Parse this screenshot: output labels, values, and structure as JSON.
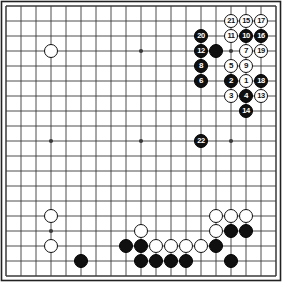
{
  "board": {
    "kind": "go-board",
    "size": 19,
    "grid_spacing": 15,
    "origin_x": 6,
    "origin_y": 6,
    "line_color": "#3a3a3a",
    "border_color": "#222222",
    "background_color": "#ffffff",
    "black_color": "#101010",
    "white_color": "#ffffff",
    "star_points": [
      {
        "col": 3,
        "row": 3
      },
      {
        "col": 9,
        "row": 3
      },
      {
        "col": 15,
        "row": 3
      },
      {
        "col": 3,
        "row": 9
      },
      {
        "col": 9,
        "row": 9
      },
      {
        "col": 15,
        "row": 9
      },
      {
        "col": 3,
        "row": 15
      },
      {
        "col": 9,
        "row": 15
      },
      {
        "col": 15,
        "row": 15
      }
    ],
    "numbered_stones": [
      {
        "label": "1",
        "color": "white",
        "col": 16,
        "row": 5
      },
      {
        "label": "2",
        "color": "black",
        "col": 15,
        "row": 5
      },
      {
        "label": "3",
        "color": "white",
        "col": 15,
        "row": 6
      },
      {
        "label": "4",
        "color": "black",
        "col": 16,
        "row": 6
      },
      {
        "label": "5",
        "color": "white",
        "col": 15,
        "row": 4
      },
      {
        "label": "6",
        "color": "black",
        "col": 13,
        "row": 5
      },
      {
        "label": "7",
        "color": "white",
        "col": 16,
        "row": 3
      },
      {
        "label": "8",
        "color": "black",
        "col": 13,
        "row": 4
      },
      {
        "label": "9",
        "color": "white",
        "col": 16,
        "row": 4
      },
      {
        "label": "10",
        "color": "black",
        "col": 16,
        "row": 2
      },
      {
        "label": "11",
        "color": "white",
        "col": 15,
        "row": 2
      },
      {
        "label": "12",
        "color": "black",
        "col": 13,
        "row": 3
      },
      {
        "label": "13",
        "color": "white",
        "col": 17,
        "row": 6
      },
      {
        "label": "14",
        "color": "black",
        "col": 16,
        "row": 7
      },
      {
        "label": "15",
        "color": "white",
        "col": 16,
        "row": 1
      },
      {
        "label": "16",
        "color": "black",
        "col": 17,
        "row": 2
      },
      {
        "label": "17",
        "color": "white",
        "col": 17,
        "row": 1
      },
      {
        "label": "18",
        "color": "black",
        "col": 17,
        "row": 5
      },
      {
        "label": "19",
        "color": "white",
        "col": 17,
        "row": 3
      },
      {
        "label": "20",
        "color": "black",
        "col": 13,
        "row": 2
      },
      {
        "label": "21",
        "color": "white",
        "col": 15,
        "row": 1
      },
      {
        "label": "22",
        "color": "black",
        "col": 13,
        "row": 9
      }
    ],
    "plain_stones": [
      {
        "color": "black",
        "col": 14,
        "row": 3
      },
      {
        "color": "white",
        "col": 3,
        "row": 3
      },
      {
        "color": "white",
        "col": 3,
        "row": 14
      },
      {
        "color": "white",
        "col": 3,
        "row": 16
      },
      {
        "color": "black",
        "col": 5,
        "row": 17
      },
      {
        "color": "white",
        "col": 9,
        "row": 15
      },
      {
        "color": "black",
        "col": 8,
        "row": 16
      },
      {
        "color": "black",
        "col": 9,
        "row": 16
      },
      {
        "color": "white",
        "col": 10,
        "row": 16
      },
      {
        "color": "white",
        "col": 11,
        "row": 16
      },
      {
        "color": "white",
        "col": 12,
        "row": 16
      },
      {
        "color": "white",
        "col": 13,
        "row": 16
      },
      {
        "color": "black",
        "col": 14,
        "row": 16
      },
      {
        "color": "black",
        "col": 9,
        "row": 17
      },
      {
        "color": "black",
        "col": 10,
        "row": 17
      },
      {
        "color": "black",
        "col": 11,
        "row": 17
      },
      {
        "color": "black",
        "col": 12,
        "row": 17
      },
      {
        "color": "black",
        "col": 15,
        "row": 17
      },
      {
        "color": "white",
        "col": 14,
        "row": 14
      },
      {
        "color": "white",
        "col": 15,
        "row": 14
      },
      {
        "color": "white",
        "col": 16,
        "row": 14
      },
      {
        "color": "white",
        "col": 14,
        "row": 15
      },
      {
        "color": "black",
        "col": 15,
        "row": 15
      },
      {
        "color": "black",
        "col": 16,
        "row": 15
      }
    ]
  }
}
